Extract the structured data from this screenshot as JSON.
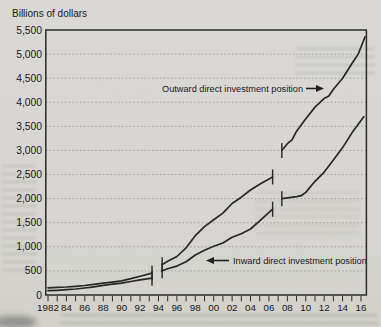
{
  "chart_data": {
    "type": "line",
    "ylabel": "Billions of dollars",
    "ylim": [
      0,
      5500
    ],
    "ytick_interval": 500,
    "ytick_labels": [
      "5,500",
      "5,000",
      "4,500",
      "4,000",
      "3,500",
      "3,000",
      "2,500",
      "2,000",
      "1,500",
      "1,000",
      "500",
      "0"
    ],
    "xlim": [
      1982,
      2017
    ],
    "xtick_every_year": true,
    "xtick_labels": [
      {
        "year": 1982,
        "label": "1982"
      },
      {
        "year": 1984,
        "label": "84"
      },
      {
        "year": 1986,
        "label": "86"
      },
      {
        "year": 1988,
        "label": "88"
      },
      {
        "year": 1990,
        "label": "90"
      },
      {
        "year": 1992,
        "label": "92"
      },
      {
        "year": 1994,
        "label": "94"
      },
      {
        "year": 1996,
        "label": "96"
      },
      {
        "year": 1998,
        "label": "98"
      },
      {
        "year": 2000,
        "label": "00"
      },
      {
        "year": 2002,
        "label": "02"
      },
      {
        "year": 2004,
        "label": "04"
      },
      {
        "year": 2006,
        "label": "06"
      },
      {
        "year": 2008,
        "label": "08"
      },
      {
        "year": 2010,
        "label": "10"
      },
      {
        "year": 2012,
        "label": "12"
      },
      {
        "year": 2014,
        "label": "14"
      },
      {
        "year": 2016,
        "label": "16"
      }
    ],
    "grid": "horizontal-dotted",
    "legend_position": "inline-annotations",
    "line_color": "#2b2b2b",
    "grid_color": "#9d9c97",
    "break_marks": "short vertical tick at each series break endpoint",
    "series": [
      {
        "id": "outward",
        "name": "Outward direct investment position",
        "segments": [
          [
            [
              1982,
              150
            ],
            [
              1983,
              157
            ],
            [
              1984,
              167
            ],
            [
              1985,
              180
            ],
            [
              1986,
              198
            ],
            [
              1987,
              222
            ],
            [
              1988,
              245
            ],
            [
              1989,
              268
            ],
            [
              1990,
              295
            ],
            [
              1991,
              340
            ],
            [
              1992,
              390
            ],
            [
              1993.3,
              455
            ]
          ],
          [
            [
              1994.4,
              630
            ],
            [
              1995,
              700
            ],
            [
              1996,
              800
            ],
            [
              1997,
              980
            ],
            [
              1998,
              1230
            ],
            [
              1999,
              1420
            ],
            [
              2000,
              1560
            ],
            [
              2001,
              1700
            ],
            [
              2002,
              1900
            ],
            [
              2003,
              2030
            ],
            [
              2004,
              2180
            ],
            [
              2005,
              2300
            ],
            [
              2006.4,
              2450
            ]
          ],
          [
            [
              2007.4,
              3000
            ],
            [
              2008,
              3140
            ],
            [
              2008.5,
              3220
            ],
            [
              2009,
              3400
            ],
            [
              2010,
              3660
            ],
            [
              2011,
              3900
            ],
            [
              2012,
              4080
            ],
            [
              2012.5,
              4130
            ],
            [
              2013,
              4270
            ],
            [
              2014,
              4500
            ],
            [
              2015,
              4800
            ],
            [
              2015.7,
              5000
            ],
            [
              2016.45,
              5360
            ]
          ]
        ]
      },
      {
        "id": "inward",
        "name": "Inward direct investment position",
        "segments": [
          [
            [
              1982,
              90
            ],
            [
              1983,
              98
            ],
            [
              1984,
              110
            ],
            [
              1985,
              125
            ],
            [
              1986,
              145
            ],
            [
              1987,
              170
            ],
            [
              1988,
              200
            ],
            [
              1989,
              225
            ],
            [
              1990,
              245
            ],
            [
              1991,
              280
            ],
            [
              1992,
              315
            ],
            [
              1993.3,
              350
            ]
          ],
          [
            [
              1994.4,
              505
            ],
            [
              1995,
              545
            ],
            [
              1996,
              600
            ],
            [
              1997,
              690
            ],
            [
              1998,
              830
            ],
            [
              1999,
              930
            ],
            [
              2000,
              1010
            ],
            [
              2001,
              1080
            ],
            [
              2002,
              1200
            ],
            [
              2003,
              1270
            ],
            [
              2004,
              1370
            ],
            [
              2005,
              1540
            ],
            [
              2006.4,
              1780
            ]
          ],
          [
            [
              2007.4,
              2000
            ],
            [
              2008,
              2015
            ],
            [
              2009,
              2040
            ],
            [
              2009.5,
              2060
            ],
            [
              2010,
              2130
            ],
            [
              2011,
              2360
            ],
            [
              2012,
              2550
            ],
            [
              2013,
              2800
            ],
            [
              2014,
              3060
            ],
            [
              2015,
              3360
            ],
            [
              2016.3,
              3700
            ]
          ]
        ]
      }
    ],
    "annotations": {
      "outward": {
        "text": "Outward direct investment position",
        "arrow": "right"
      },
      "inward": {
        "text": "Inward direct investment position",
        "arrow": "left"
      }
    }
  }
}
